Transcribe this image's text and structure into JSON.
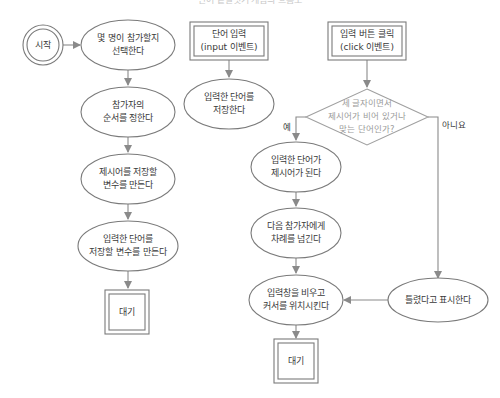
{
  "caption": "단어 끝말잇기 게임의 흐름도",
  "nodes": {
    "start": {
      "label": "시작"
    },
    "choose_players": {
      "lines": [
        "몇 명이 참가할지",
        "선택한다"
      ]
    },
    "set_order": {
      "lines": [
        "참가자의",
        "순서를 정한다"
      ]
    },
    "make_word_var": {
      "lines": [
        "제시어를 저장할",
        "변수를 만든다"
      ]
    },
    "make_input_var": {
      "lines": [
        "입력한 단어를",
        "저장할 변수를 만든다"
      ]
    },
    "wait_left": {
      "label": "대기"
    },
    "input_event": {
      "lines": [
        "단어 입력",
        "(input 이벤트)"
      ]
    },
    "store_word": {
      "lines": [
        "입력한 단어를",
        "저장한다"
      ]
    },
    "click_event": {
      "lines": [
        "입력 버튼 클릭",
        "(click 이벤트)"
      ]
    },
    "decision": {
      "lines": [
        "세 글자이면서",
        "제시어가 비어 있거나",
        "맞는 단어인가?"
      ]
    },
    "becomes_word": {
      "lines": [
        "입력한 단어가",
        "제시어가 된다"
      ]
    },
    "next_turn": {
      "lines": [
        "다음 참가자에게",
        "차례를 넘긴다"
      ]
    },
    "clear_input": {
      "lines": [
        "입력창을 비우고",
        "커서를 위치시킨다"
      ]
    },
    "show_wrong": {
      "lines": [
        "틀렸다고 표시한다"
      ]
    },
    "wait_right": {
      "label": "대기"
    }
  },
  "edges": {
    "yes_label": "예",
    "no_label": "아니요"
  }
}
